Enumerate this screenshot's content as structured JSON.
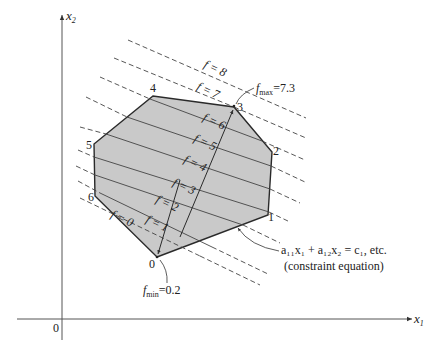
{
  "diagram": {
    "type": "linear-programming-feasible-region",
    "axes": {
      "x_label": "x",
      "x_sub": "1",
      "y_label": "x",
      "y_sub": "2",
      "origin_label": "0"
    },
    "vertices": [
      {
        "label": "0",
        "x": 157,
        "y": 257
      },
      {
        "label": "1",
        "x": 268,
        "y": 215
      },
      {
        "label": "2",
        "x": 272,
        "y": 152
      },
      {
        "label": "3",
        "x": 234,
        "y": 107
      },
      {
        "label": "4",
        "x": 153,
        "y": 96
      },
      {
        "label": "5",
        "x": 94,
        "y": 144
      },
      {
        "label": "6",
        "x": 95,
        "y": 196
      }
    ],
    "isolines": [
      {
        "f": "0",
        "label": "f = 0"
      },
      {
        "f": "1",
        "label": "f = 1"
      },
      {
        "f": "2",
        "label": "f = 2"
      },
      {
        "f": "3",
        "label": "f = 3"
      },
      {
        "f": "4",
        "label": "f = 4"
      },
      {
        "f": "5",
        "label": "f = 5"
      },
      {
        "f": "6",
        "label": "f = 6"
      },
      {
        "f": "7",
        "label": "f = 7"
      },
      {
        "f": "8",
        "label": "f = 8"
      }
    ],
    "annotations": {
      "fmax_label": "f",
      "fmax_sub": "max",
      "fmax_value": "=7.3",
      "fmin_label": "f",
      "fmin_sub": "min",
      "fmin_value": "=0.2",
      "constraint_equation": "a₁₁x₁ + a₁₂x₂ = c₁, etc.",
      "constraint_caption": "(constraint equation)"
    },
    "colors": {
      "region_fill": "#c8c8c8",
      "line": "#2a2a2a",
      "dashed": "#555555",
      "background": "#ffffff"
    }
  }
}
